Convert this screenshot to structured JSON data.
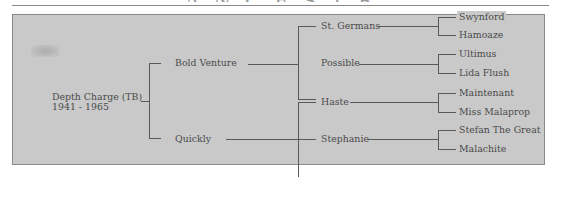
{
  "page": {
    "heading_fragment": "ANCESTRY"
  },
  "pedigree": {
    "subject": {
      "name": "Depth Charge (TB)",
      "years": "1941 - 1965"
    },
    "sire": {
      "name": "Bold Venture",
      "sire": {
        "name": "St. Germans",
        "sire": "Swynford",
        "dam": "Hamoaze"
      },
      "dam": {
        "name": "Possible",
        "sire": "Ultimus",
        "dam": "Lida Flush"
      }
    },
    "dam": {
      "name": "Quickly",
      "sire": {
        "name": "Haste",
        "sire": "Maintenant",
        "dam": "Miss Malaprop"
      },
      "dam": {
        "name": "Stephanie",
        "sire": "Stefan The Great",
        "dam": "Malachite"
      }
    }
  },
  "colors": {
    "background": "#c9c9c9",
    "line": "#5a5a5a",
    "text": "#4a4a4a",
    "border": "#8a8a8a"
  }
}
